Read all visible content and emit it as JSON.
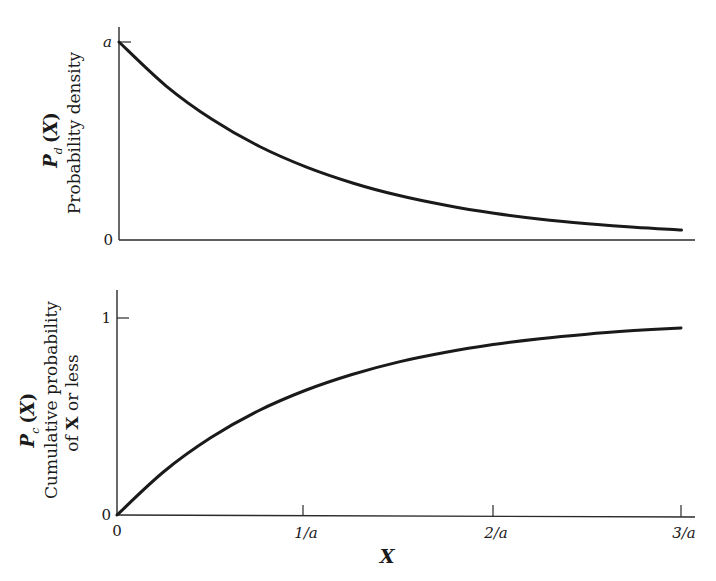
{
  "chart_data": [
    {
      "type": "line",
      "panel": "top",
      "title": "",
      "ylabel": "P_d(X) Probability density",
      "ylabel_lines": {
        "symbol": "P",
        "subscript": "d",
        "arg_open": "(",
        "arg": "X",
        "arg_close": ")",
        "line2": "Probability density"
      },
      "xlabel": "",
      "y_ticks": [
        {
          "label": "a",
          "value": 1.0
        },
        {
          "label": "0",
          "value": 0.0
        }
      ],
      "x_range": [
        0,
        3
      ],
      "ylim": [
        0,
        1.08
      ],
      "function": "a * exp(-a X)",
      "series": [
        {
          "name": "Probability density",
          "x": [
            0,
            0.25,
            0.5,
            0.75,
            1.0,
            1.25,
            1.5,
            1.75,
            2.0,
            2.25,
            2.5,
            2.75,
            3.0
          ],
          "values": [
            1.0,
            0.779,
            0.607,
            0.472,
            0.368,
            0.287,
            0.223,
            0.174,
            0.135,
            0.105,
            0.082,
            0.064,
            0.05
          ]
        }
      ],
      "grid": false,
      "legend": "none"
    },
    {
      "type": "line",
      "panel": "bottom",
      "title": "",
      "ylabel": "P_c(X) Cumulative probability of X or less",
      "ylabel_lines": {
        "symbol": "P",
        "subscript": "c",
        "arg_open": "(",
        "arg": "X",
        "arg_close": ")",
        "line2": "Cumulative probability",
        "line3_pre": "of ",
        "line3_bold": "X",
        "line3_post": " or less"
      },
      "xlabel": "X",
      "x_ticks": [
        {
          "label": "0",
          "value": 0
        },
        {
          "label": "1/a",
          "value": 1
        },
        {
          "label": "2/a",
          "value": 2
        },
        {
          "label": "3/a",
          "value": 3
        }
      ],
      "y_ticks": [
        {
          "label": "1",
          "value": 1.0
        },
        {
          "label": "0",
          "value": 0.0
        }
      ],
      "x_range": [
        0,
        3
      ],
      "ylim": [
        0,
        1.14
      ],
      "function": "1 - exp(-a X)",
      "series": [
        {
          "name": "Cumulative probability",
          "x": [
            0,
            0.25,
            0.5,
            0.75,
            1.0,
            1.25,
            1.5,
            1.75,
            2.0,
            2.25,
            2.5,
            2.75,
            3.0
          ],
          "values": [
            0.0,
            0.221,
            0.393,
            0.528,
            0.632,
            0.713,
            0.777,
            0.826,
            0.865,
            0.895,
            0.918,
            0.936,
            0.95
          ]
        }
      ],
      "grid": false,
      "legend": "none"
    }
  ],
  "colors": {
    "curve": "#1a1a1a",
    "axis": "#2a2a2a",
    "background": "#ffffff"
  }
}
